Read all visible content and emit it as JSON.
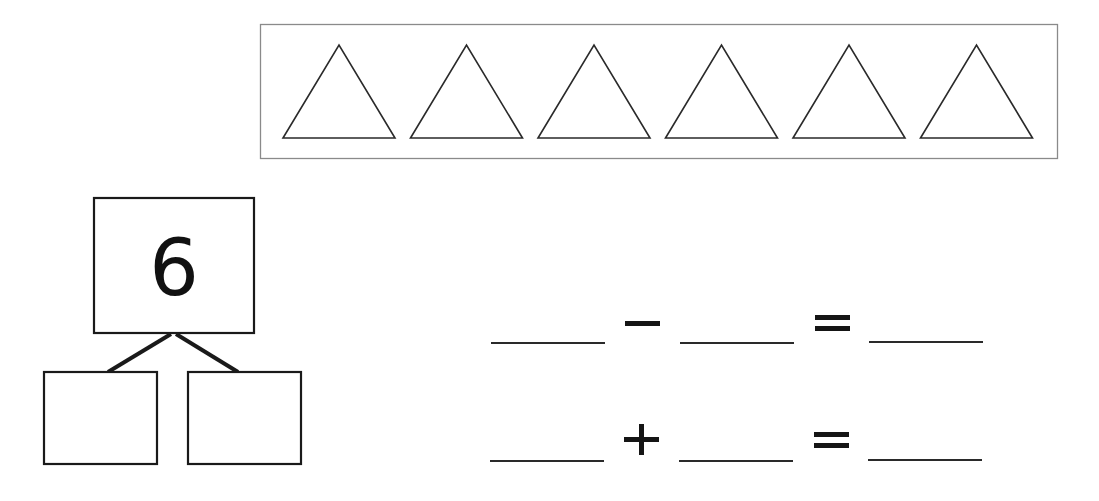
{
  "worksheet": {
    "picture_frame": {
      "shape": "triangle",
      "count": 6,
      "shapes": [
        {
          "name": "triangle-1"
        },
        {
          "name": "triangle-2"
        },
        {
          "name": "triangle-3"
        },
        {
          "name": "triangle-4"
        },
        {
          "name": "triangle-5"
        },
        {
          "name": "triangle-6"
        }
      ]
    },
    "number_bond": {
      "whole": "6",
      "part_left": "",
      "part_right": ""
    },
    "equations": [
      {
        "first": "",
        "operator": "−",
        "second": "",
        "equals": "=",
        "result": ""
      },
      {
        "first": "",
        "operator": "+",
        "second": "",
        "equals": "=",
        "result": ""
      }
    ],
    "colors": {
      "stroke": "#222222",
      "frame": "#888888",
      "background": "#ffffff"
    }
  }
}
